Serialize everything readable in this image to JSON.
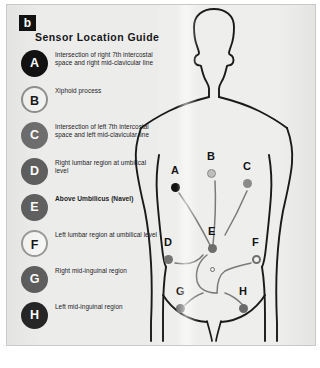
{
  "figure": {
    "panel_label": "b",
    "title": "Sensor Location Guide"
  },
  "colors": {
    "plate_background": "#eeeeec",
    "legend_background": "#ececeb",
    "ink": "#1c1d1f",
    "badge_black": "#121212",
    "badge_dark": "#2a2a2a",
    "badge_gray": "#6e6e6e",
    "badge_white": "#f4f4f2",
    "outline": "#1a1a1a"
  },
  "legend": {
    "items": [
      {
        "id": "A",
        "label": "A",
        "description": "Intersection of right 7th intercostal space and right mid-clavicular line",
        "fill": "#121212",
        "text_color": "#ffffff",
        "border": "none",
        "bold": false
      },
      {
        "id": "B",
        "label": "B",
        "description": "Xiphoid process",
        "fill": "#f2f2f0",
        "text_color": "#1a1a1a",
        "border": "2px solid #8f8f8f",
        "bold": false
      },
      {
        "id": "C",
        "label": "C",
        "description": "Intersection of left 7th intercostal space and left mid-clavicular line",
        "fill": "#6e6e6e",
        "text_color": "#ffffff",
        "border": "none",
        "bold": false
      },
      {
        "id": "D",
        "label": "D",
        "description": "Right lumbar region at umbilical level",
        "fill": "#5f5f5f",
        "text_color": "#ffffff",
        "border": "none",
        "bold": false
      },
      {
        "id": "E",
        "label": "E",
        "description": "Above Umbilicus (Navel)",
        "fill": "#606060",
        "text_color": "#ffffff",
        "border": "none",
        "bold": true
      },
      {
        "id": "F",
        "label": "F",
        "description": "Left lumbar region at umbilical level",
        "fill": "#f6f6f4",
        "text_color": "#151515",
        "border": "2px solid #9a9a9a",
        "bold": false
      },
      {
        "id": "G",
        "label": "G",
        "description": "Right mid-inguinal region",
        "fill": "#5e5e5e",
        "text_color": "#ffffff",
        "border": "none",
        "bold": false
      },
      {
        "id": "H",
        "label": "H",
        "description": "Left mid-inguinal region",
        "fill": "#262626",
        "text_color": "#ffffff",
        "border": "none",
        "bold": false
      }
    ]
  },
  "body_diagram": {
    "description": "Anterior torso outline with eight sensor placements",
    "sensors": [
      {
        "id": "A",
        "label": "A",
        "x": 42,
        "y": 182,
        "fill": "#131313",
        "border": "none",
        "size": 9
      },
      {
        "id": "B",
        "label": "B",
        "x": 78,
        "y": 168,
        "fill": "#bdbdbb",
        "border": "1px solid #8a8a8a",
        "size": 9
      },
      {
        "id": "C",
        "label": "C",
        "x": 114,
        "y": 178,
        "fill": "#8a8a8a",
        "border": "none",
        "size": 9
      },
      {
        "id": "D",
        "label": "D",
        "x": 35,
        "y": 254,
        "fill": "#737373",
        "border": "none",
        "size": 9
      },
      {
        "id": "E",
        "label": "E",
        "x": 79,
        "y": 243,
        "fill": "#6d6d6d",
        "border": "none",
        "size": 9
      },
      {
        "id": "F",
        "label": "F",
        "x": 123,
        "y": 254,
        "fill": "#f2f2f0",
        "border": "2px solid #6e6e6e",
        "size": 9
      },
      {
        "id": "G",
        "label": "G",
        "x": 47,
        "y": 303,
        "fill": "#6f6f6f",
        "border": "none",
        "size": 9
      },
      {
        "id": "H",
        "label": "H",
        "x": 110,
        "y": 303,
        "fill": "#6b6b6b",
        "border": "none",
        "size": 9
      }
    ],
    "navel": {
      "x": 79,
      "y": 257
    }
  }
}
